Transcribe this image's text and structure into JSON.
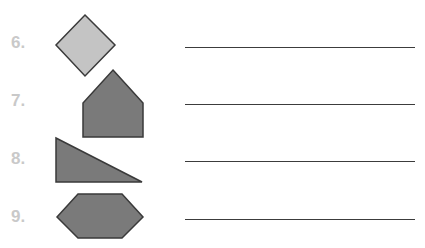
{
  "worksheet": {
    "items": [
      {
        "number": "6.",
        "shape": "diamond-icon",
        "fill": "#c4c4c4",
        "answer": ""
      },
      {
        "number": "7.",
        "shape": "pentagon-icon",
        "fill": "#7a7a7a",
        "answer": ""
      },
      {
        "number": "8.",
        "shape": "right-triangle-icon",
        "fill": "#7a7a7a",
        "answer": ""
      },
      {
        "number": "9.",
        "shape": "hexagon-icon",
        "fill": "#7a7a7a",
        "answer": ""
      }
    ],
    "colors": {
      "label": "#c9c9c9",
      "stroke": "#3a3a3a",
      "line": "#3c3c3c",
      "light_fill": "#c4c4c4",
      "dark_fill": "#7a7a7a"
    }
  }
}
